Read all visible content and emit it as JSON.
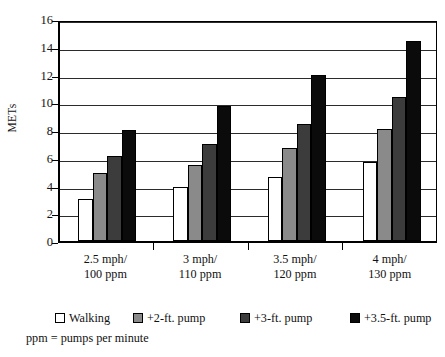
{
  "figure": {
    "title_cropped": "",
    "note": "ppm = pumps per minute"
  },
  "chart_data": {
    "type": "bar",
    "title": "",
    "xlabel": "",
    "ylabel": "METs",
    "ylim": [
      0,
      16
    ],
    "ytick_step": 2,
    "yticks": [
      16,
      14,
      12,
      10,
      8,
      6,
      4,
      2,
      0
    ],
    "ytick_labels": [
      "16",
      "14",
      "12",
      "10",
      "8",
      "6",
      "4",
      "2",
      "0"
    ],
    "grid": true,
    "legend_position": "bottom",
    "categories": [
      "2.5 mph/\n100 ppm",
      "3 mph/\n110 ppm",
      "3.5 mph/\n120 ppm",
      "4 mph/\n130 ppm"
    ],
    "category_lines": [
      [
        "2.5 mph/",
        "100 ppm"
      ],
      [
        "3 mph/",
        "110 ppm"
      ],
      [
        "3.5 mph/",
        "120 ppm"
      ],
      [
        "4 mph/",
        "130 ppm"
      ]
    ],
    "series": [
      {
        "name": "Walking",
        "color": "#ffffff",
        "values": [
          3.0,
          3.9,
          4.6,
          5.7
        ]
      },
      {
        "name": "+2-ft. pump",
        "color": "#8a8a8a",
        "values": [
          4.9,
          5.5,
          6.7,
          8.1
        ]
      },
      {
        "name": "+3-ft. pump",
        "color": "#3c3c3c",
        "values": [
          6.1,
          7.0,
          8.4,
          10.4
        ]
      },
      {
        "name": "+3.5-ft. pump",
        "color": "#0b0b0b",
        "values": [
          8.0,
          9.7,
          12.0,
          14.4
        ]
      }
    ]
  }
}
